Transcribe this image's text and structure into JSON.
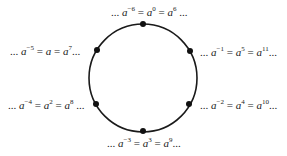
{
  "diagram": {
    "type": "cyclic-group-circle",
    "circle": {
      "cx": 143,
      "cy": 77,
      "r": 54,
      "stroke": "#1a1a1a"
    },
    "nodes": [
      {
        "id": "top",
        "x": 143,
        "y": 24,
        "label": {
          "prefix": "... ",
          "terms": [
            {
              "b": "a",
              "e": "−6"
            },
            {
              "b": "a",
              "e": "0"
            },
            {
              "b": "a",
              "e": "6"
            }
          ],
          "suffix": " ..."
        }
      },
      {
        "id": "upper-right",
        "x": 190,
        "y": 51,
        "label": {
          "prefix": "... ",
          "terms": [
            {
              "b": "a",
              "e": "−1"
            },
            {
              "b": "a",
              "e": "5"
            },
            {
              "b": "a",
              "e": "11"
            }
          ],
          "suffix": "..."
        }
      },
      {
        "id": "lower-right",
        "x": 189,
        "y": 104,
        "label": {
          "prefix": "... ",
          "terms": [
            {
              "b": "a",
              "e": "−2"
            },
            {
              "b": "a",
              "e": "4"
            },
            {
              "b": "a",
              "e": "10"
            }
          ],
          "suffix": "..."
        }
      },
      {
        "id": "bottom",
        "x": 143,
        "y": 131,
        "label": {
          "prefix": "... ",
          "terms": [
            {
              "b": "a",
              "e": "−3"
            },
            {
              "b": "a",
              "e": "3"
            },
            {
              "b": "a",
              "e": "9"
            }
          ],
          "suffix": "..."
        }
      },
      {
        "id": "lower-left",
        "x": 96,
        "y": 104,
        "label": {
          "prefix": "... ",
          "terms": [
            {
              "b": "a",
              "e": "−4"
            },
            {
              "b": "a",
              "e": "2"
            },
            {
              "b": "a",
              "e": "8"
            }
          ],
          "suffix": " ..."
        }
      },
      {
        "id": "upper-left",
        "x": 97,
        "y": 50,
        "label": {
          "prefix": "... ",
          "terms": [
            {
              "b": "a",
              "e": "−5"
            },
            {
              "b": "a",
              "e": ""
            },
            {
              "b": "a",
              "e": "7"
            }
          ],
          "suffix": "..."
        }
      }
    ]
  },
  "labels": {
    "top": {
      "pre": "... ",
      "b1": "a",
      "e1": "−6",
      "eq1": " = ",
      "b2": "a",
      "e2": "0",
      "eq2": " = ",
      "b3": "a",
      "e3": "6",
      "post": " ..."
    },
    "upper_right": {
      "pre": "... ",
      "b1": "a",
      "e1": "−1",
      "eq1": " = ",
      "b2": "a",
      "e2": "5",
      "eq2": " = ",
      "b3": "a",
      "e3": "11",
      "post": "..."
    },
    "lower_right": {
      "pre": "... ",
      "b1": "a",
      "e1": "−2",
      "eq1": " = ",
      "b2": "a",
      "e2": "4",
      "eq2": " = ",
      "b3": "a",
      "e3": "10",
      "post": "..."
    },
    "bottom": {
      "pre": "... ",
      "b1": "a",
      "e1": "−3",
      "eq1": " = ",
      "b2": "a",
      "e2": "3",
      "eq2": " = ",
      "b3": "a",
      "e3": "9",
      "post": "..."
    },
    "lower_left": {
      "pre": "... ",
      "b1": "a",
      "e1": "−4",
      "eq1": " = ",
      "b2": "a",
      "e2": "2",
      "eq2": " = ",
      "b3": "a",
      "e3": "8",
      "post": " ..."
    },
    "upper_left": {
      "pre": "... ",
      "b1": "a",
      "e1": "−5",
      "eq1": " = ",
      "b2": "a",
      "e2": "",
      "eq2": " = ",
      "b3": "a",
      "e3": "7",
      "post": "..."
    }
  }
}
